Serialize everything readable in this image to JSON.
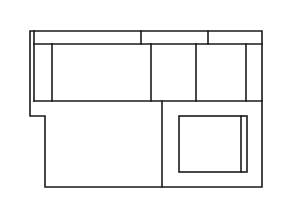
{
  "diagram": {
    "type": "floor-plan-line-drawing",
    "stroke_color": "#1a1a1a",
    "background": "#ffffff",
    "outline": {
      "points": [
        [
          30,
          31
        ],
        [
          262,
          31
        ],
        [
          262,
          187
        ],
        [
          45,
          187
        ],
        [
          45,
          116
        ],
        [
          30,
          116
        ]
      ]
    },
    "inner_left_line": {
      "x": 34,
      "y1": 31,
      "y2": 101
    },
    "top_band": {
      "y_top": 31,
      "y_bottom": 44,
      "dividers_x": [
        141,
        208
      ]
    },
    "middle_row": {
      "y_top": 44,
      "y_bottom": 101,
      "dividers_x": [
        52,
        151,
        196,
        246
      ]
    },
    "lower_section": {
      "divider_x": 162,
      "y_top": 101,
      "y_bottom": 187
    },
    "inner_box": {
      "x": 179,
      "y": 116,
      "width": 68,
      "height": 56,
      "inner_line_x": 241
    }
  }
}
